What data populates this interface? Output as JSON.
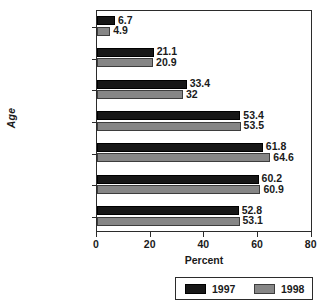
{
  "chart_data": {
    "type": "bar",
    "orientation": "horizontal",
    "title": "",
    "xlabel": "Percent",
    "ylabel": "Age",
    "xlim": [
      0,
      80
    ],
    "xticks": [
      0,
      20,
      40,
      60,
      80
    ],
    "xtick_labels": [
      "0",
      "20",
      "40",
      "60",
      "80"
    ],
    "grid": false,
    "legend_position": "bottom-right",
    "categories": [
      "12–13",
      "14–15",
      "16–17",
      "18–20",
      "21–25",
      "26–34",
      "35 & older"
    ],
    "series": [
      {
        "name": "1997",
        "color": "#171717",
        "values": [
          6.7,
          21.1,
          33.4,
          53.4,
          61.8,
          60.2,
          52.8
        ],
        "value_labels": [
          "6.7",
          "21.1",
          "33.4",
          "53.4",
          "61.8",
          "60.2",
          "52.8"
        ]
      },
      {
        "name": "1998",
        "color": "#868686",
        "values": [
          4.9,
          20.9,
          32,
          53.5,
          64.6,
          60.9,
          53.1
        ],
        "value_labels": [
          "4.9",
          "20.9",
          "32",
          "53.5",
          "64.6",
          "60.9",
          "53.1"
        ]
      }
    ]
  },
  "legend": {
    "entries": [
      {
        "label": "1997",
        "color": "#171717"
      },
      {
        "label": "1998",
        "color": "#868686"
      }
    ]
  }
}
